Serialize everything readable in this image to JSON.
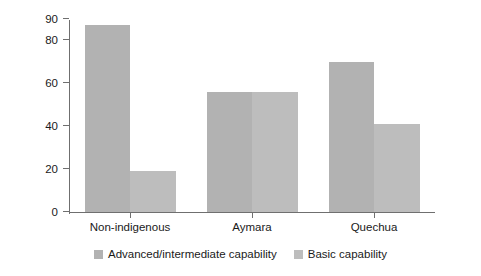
{
  "chart_data": {
    "type": "bar",
    "title": "",
    "subtitle": "",
    "xlabel": "",
    "ylabel": "Percentage",
    "categories": [
      "Non-indigenous",
      "Aymara",
      "Quechua"
    ],
    "series": [
      {
        "name": "Advanced/intermediate capability",
        "values": [
          87,
          56,
          70
        ],
        "color": "#b2b2b2"
      },
      {
        "name": "Basic capability",
        "values": [
          19,
          56,
          41
        ],
        "color": "#bdbdbd"
      }
    ],
    "ylim": [
      0,
      90
    ],
    "yticks": [
      0,
      20,
      40,
      60,
      80,
      90
    ],
    "ytick_labels": [
      "0",
      "20",
      "40",
      "60",
      "80",
      "90"
    ],
    "grid": false,
    "legend_position": "bottom"
  },
  "axis": {
    "line_color": "#6f6f6f",
    "text_color": "#1a1a1a"
  },
  "legend": {
    "items": [
      {
        "label": "Advanced/intermediate capability",
        "color": "#b2b2b2"
      },
      {
        "label": "Basic capability",
        "color": "#bdbdbd"
      }
    ]
  }
}
